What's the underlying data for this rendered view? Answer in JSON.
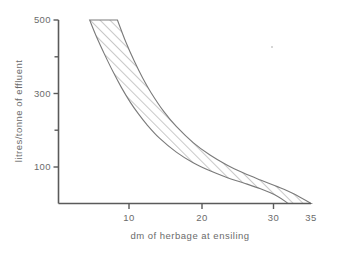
{
  "figure": {
    "name": "effluent-vs-dry-matter-chart",
    "background_color": "#ffffff",
    "line_color": "#6b6b6b"
  },
  "chart_data": {
    "type": "area",
    "title": "",
    "subtitle": "",
    "xlabel": "dm of herbage at ensiling",
    "ylabel": "litres/tonne of effluent",
    "xlim": [
      5,
      35
    ],
    "ylim": [
      0,
      500
    ],
    "xticks": [
      10,
      20,
      30,
      35
    ],
    "xtick_labels": [
      "10",
      "20",
      "30",
      "35"
    ],
    "yticks": [
      100,
      200,
      300,
      400,
      500
    ],
    "ytick_labels": [
      "100",
      "",
      "300",
      "",
      "500"
    ],
    "grid": false,
    "legend": null,
    "annotations": [],
    "series": [
      {
        "name": "upper bound of effluent band",
        "x": [
          8.7,
          9.5,
          10.5,
          11.5,
          12.5,
          13.5,
          14.5,
          15.5,
          17.0,
          19.0,
          21.0,
          23.0,
          25.0,
          27.0,
          29.0,
          31.0,
          32.3
        ],
        "values": [
          500,
          455,
          405,
          358,
          315,
          277,
          244,
          215,
          178,
          140,
          111,
          89,
          71,
          56,
          40,
          20,
          0
        ]
      },
      {
        "name": "lower bound of effluent band",
        "x": [
          12.0,
          13.0,
          14.0,
          15.0,
          16.0,
          17.5,
          19.0,
          21.0,
          23.0,
          25.0,
          27.0,
          29.0,
          31.0,
          33.0,
          35.0
        ],
        "values": [
          500,
          440,
          388,
          342,
          302,
          251,
          210,
          166,
          132,
          105,
          83,
          64,
          46,
          26,
          0
        ]
      }
    ],
    "band_fill": "hatched-diagonal"
  },
  "axes": {
    "x_axis_label": "dm of herbage at ensiling",
    "y_axis_label": "litres/tonne of effluent",
    "x_tick_10": "10",
    "x_tick_20": "20",
    "x_tick_30": "30",
    "x_tick_35": "35",
    "y_tick_100": "100",
    "y_tick_300": "300",
    "y_tick_500": "500"
  }
}
